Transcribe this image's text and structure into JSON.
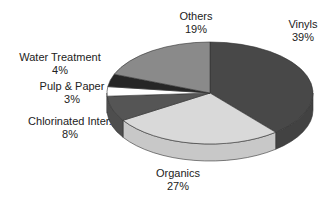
{
  "chart_data": {
    "type": "pie",
    "style": "3d",
    "title": "",
    "slices": [
      {
        "label": "Vinyls",
        "value": 39,
        "pct_text": "39%",
        "color": "#484848"
      },
      {
        "label": "Organics",
        "value": 27,
        "pct_text": "27%",
        "color": "#d9d9d9"
      },
      {
        "label": "Chlorinated Inter.",
        "value": 8,
        "pct_text": "8%",
        "color": "#555555"
      },
      {
        "label": "Pulp & Paper",
        "value": 3,
        "pct_text": "3%",
        "color": "#ffffff"
      },
      {
        "label": "Water Treatment",
        "value": 4,
        "pct_text": "4%",
        "color": "#262626"
      },
      {
        "label": "Others",
        "value": 19,
        "pct_text": "19%",
        "color": "#8a8a8a"
      }
    ],
    "start_angle_deg": 0,
    "direction": "clockwise",
    "legend": "none (labels placed outside slices)"
  },
  "labels": {
    "vinyls": {
      "name": "Vinyls",
      "pct": "39%"
    },
    "organics": {
      "name": "Organics",
      "pct": "27%"
    },
    "chlorinated": {
      "name": "Chlorinated Inter.",
      "pct": "8%"
    },
    "pulp": {
      "name": "Pulp & Paper",
      "pct": "3%"
    },
    "water": {
      "name": "Water Treatment",
      "pct": "4%"
    },
    "others": {
      "name": "Others",
      "pct": "19%"
    }
  }
}
